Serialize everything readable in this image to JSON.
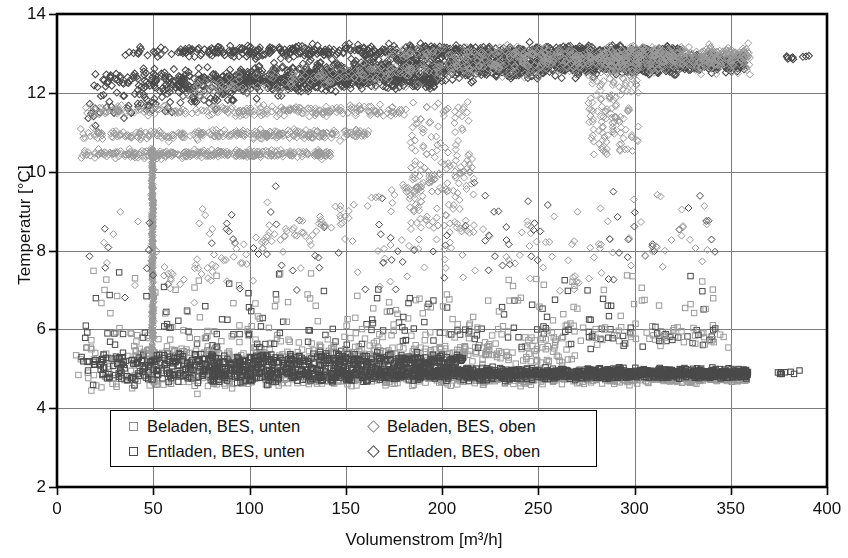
{
  "chart_data": {
    "type": "scatter",
    "title": "",
    "xlabel": "Volumenstrom [m³/h]",
    "ylabel": "Temperatur [°C]",
    "xlim": [
      0,
      400
    ],
    "ylim": [
      2,
      14
    ],
    "xticks": [
      0,
      50,
      100,
      150,
      200,
      250,
      300,
      350,
      400
    ],
    "yticks": [
      2,
      4,
      6,
      8,
      10,
      12,
      14
    ],
    "grid": true,
    "legend_position": "inside-bottom-left",
    "series": [
      {
        "name": "Beladen, BES, unten",
        "marker": "square",
        "color": "#9a9a9a",
        "description": "Lower temperature band, light grey squares, roughly 4.4-5.6 °C across the whole flow range, with scattered outliers up to 8 °C.",
        "band_y": [
          4.4,
          5.6
        ],
        "x_range": [
          8,
          360
        ],
        "n_points": 900
      },
      {
        "name": "Beladen, BES, oben",
        "marker": "diamond",
        "color": "#9a9a9a",
        "description": "Upper temperature band, light grey diamonds, rising from about 10.3 °C at low flow to 12.9 °C near 300 m³/h, plus a light streak near 50 m³/h descending from 10.5 to 5 °C.",
        "band_y": [
          10.3,
          13.0
        ],
        "x_range": [
          10,
          360
        ],
        "n_points": 900
      },
      {
        "name": "Entladen, BES, unten",
        "marker": "square",
        "color": "#4a4a4a",
        "description": "Lower temperature band, dark grey squares, dense core near 4.6-5.2 °C, extending to 360 m³/h with an isolated group near 380 m³/h at 4.9 °C.",
        "band_y": [
          4.5,
          5.3
        ],
        "x_range": [
          10,
          390
        ],
        "n_points": 1100
      },
      {
        "name": "Entladen, BES, oben",
        "marker": "diamond",
        "color": "#4a4a4a",
        "description": "Upper temperature band, dark grey diamonds, dense core rising from 11.3 °C at low flow to about 12.8 °C beyond 250 m³/h, with an isolated group near 385 m³/h at 12.9 °C.",
        "band_y": [
          11.2,
          13.3
        ],
        "x_range": [
          12,
          390
        ],
        "n_points": 1300
      }
    ],
    "annotations": [
      "Vertical light-grey streak at approximately 50 m³/h spanning 5 to 10.5 °C",
      "Isolated marker groups near 380-390 m³/h at 4.9 °C and 12.9 °C",
      "Sparse scatter between the two main bands in the 6-10 °C range"
    ]
  },
  "axis": {
    "x_title": "Volumenstrom [m³/h]",
    "y_title": "Temperatur [°C]",
    "x_tick_labels": [
      "0",
      "50",
      "100",
      "150",
      "200",
      "250",
      "300",
      "350",
      "400"
    ],
    "y_tick_labels": [
      "2",
      "4",
      "6",
      "8",
      "10",
      "12",
      "14"
    ]
  },
  "legend": {
    "items": [
      {
        "label": "Beladen, BES, unten",
        "marker": "square",
        "shade": "light"
      },
      {
        "label": "Beladen, BES, oben",
        "marker": "diamond",
        "shade": "light"
      },
      {
        "label": "Entladen, BES, unten",
        "marker": "square",
        "shade": "dark"
      },
      {
        "label": "Entladen, BES, oben",
        "marker": "diamond",
        "shade": "dark"
      }
    ]
  },
  "colors": {
    "light_marker": "#9a9a9a",
    "dark_marker": "#4a4a4a",
    "grid": "#7d7d7d",
    "frame": "#000000",
    "text": "#111111",
    "background": "#ffffff"
  }
}
